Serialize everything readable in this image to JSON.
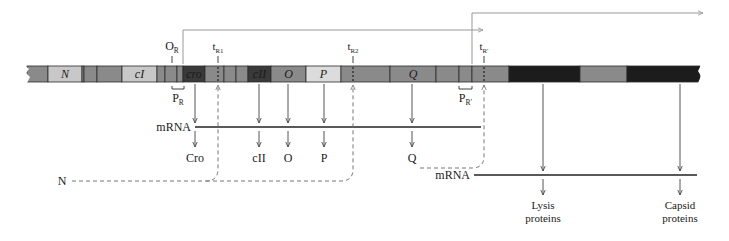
{
  "colors": {
    "mid_gray": "#8a8a8a",
    "light_gray": "#c8c8c8",
    "lighter_gray": "#dcdcdc",
    "dark_gray": "#3a3a3a",
    "darkest": "#1c1c1c",
    "line": "#555555",
    "arrow_gray": "#999999",
    "dash": "#777777",
    "text": "#1a1a1a"
  },
  "dna": {
    "y": 66,
    "height": 16,
    "x_start": 27,
    "x_end": 700,
    "segments": [
      {
        "x0": 27,
        "x1": 48,
        "fill": "mid_gray",
        "label": ""
      },
      {
        "x0": 48,
        "x1": 82,
        "fill": "light_gray",
        "label": "N"
      },
      {
        "x0": 82,
        "x1": 84,
        "fill": "mid_gray",
        "label": ""
      },
      {
        "x0": 84,
        "x1": 97,
        "fill": "mid_gray",
        "label": ""
      },
      {
        "x0": 97,
        "x1": 122,
        "fill": "mid_gray",
        "label": ""
      },
      {
        "x0": 122,
        "x1": 157,
        "fill": "light_gray",
        "label": "cI"
      },
      {
        "x0": 157,
        "x1": 165,
        "fill": "mid_gray",
        "label": ""
      },
      {
        "x0": 165,
        "x1": 177,
        "fill": "mid_gray",
        "label": ""
      },
      {
        "x0": 177,
        "x1": 183,
        "fill": "mid_gray",
        "label": ""
      },
      {
        "x0": 183,
        "x1": 205,
        "fill": "dark_gray",
        "label": "cro"
      },
      {
        "x0": 205,
        "x1": 224,
        "fill": "mid_gray",
        "label": ""
      },
      {
        "x0": 224,
        "x1": 236,
        "fill": "mid_gray",
        "label": ""
      },
      {
        "x0": 236,
        "x1": 248,
        "fill": "mid_gray",
        "label": ""
      },
      {
        "x0": 248,
        "x1": 271,
        "fill": "dark_gray",
        "label": "cII"
      },
      {
        "x0": 271,
        "x1": 306,
        "fill": "mid_gray",
        "label": "O"
      },
      {
        "x0": 306,
        "x1": 341,
        "fill": "lighter_gray",
        "label": "P"
      },
      {
        "x0": 341,
        "x1": 390,
        "fill": "mid_gray",
        "label": ""
      },
      {
        "x0": 390,
        "x1": 436,
        "fill": "mid_gray",
        "label": "Q"
      },
      {
        "x0": 436,
        "x1": 459,
        "fill": "mid_gray",
        "label": ""
      },
      {
        "x0": 459,
        "x1": 472,
        "fill": "mid_gray",
        "label": ""
      },
      {
        "x0": 472,
        "x1": 509,
        "fill": "mid_gray",
        "label": ""
      },
      {
        "x0": 509,
        "x1": 580,
        "fill": "darkest",
        "label": ""
      },
      {
        "x0": 580,
        "x1": 627,
        "fill": "mid_gray",
        "label": ""
      },
      {
        "x0": 627,
        "x1": 700,
        "fill": "darkest",
        "label": ""
      }
    ]
  },
  "sites": {
    "O_R": {
      "main": "O",
      "sub": "R",
      "x": 172
    },
    "t_R1": {
      "main": "t",
      "sub": "R1",
      "x": 218
    },
    "t_R2": {
      "main": "t",
      "sub": "R2",
      "x": 353
    },
    "t_Rp": {
      "main": "t",
      "sub": "R′",
      "x": 484
    },
    "P_R": {
      "main": "P",
      "sub": "R",
      "x0": 172,
      "x1": 184
    },
    "P_Rp": {
      "main": "P",
      "sub": "R′",
      "x0": 459,
      "x1": 472
    }
  },
  "transcripts": [
    {
      "name": "early-transcript",
      "x_start": 183,
      "y_top": 30,
      "x_end": 483
    },
    {
      "name": "late-transcript",
      "x_start": 472,
      "y_top": 13,
      "x_end": 703
    }
  ],
  "mrna_lines": [
    {
      "label": "mRNA",
      "y": 127,
      "x0": 195,
      "x1": 481
    },
    {
      "label": "mRNA",
      "y": 175,
      "x0": 474,
      "x1": 697
    }
  ],
  "products": [
    {
      "gene": "cro",
      "label": "Cro",
      "x": 195
    },
    {
      "gene": "cII",
      "label": "cII",
      "x": 259
    },
    {
      "gene": "O",
      "label": "O",
      "x": 288
    },
    {
      "gene": "P",
      "label": "P",
      "x": 324
    },
    {
      "gene": "Q",
      "label": "Q",
      "x": 412
    }
  ],
  "late_products": [
    {
      "label_line1": "Lysis",
      "label_line2": "proteins",
      "x": 543
    },
    {
      "label_line1": "Capsid",
      "label_line2": "proteins",
      "x": 680
    }
  ],
  "regulators": {
    "N": {
      "label": "N",
      "x": 62,
      "y": 181
    },
    "Q": {
      "label": "Q",
      "x": 412,
      "y": 168
    }
  }
}
